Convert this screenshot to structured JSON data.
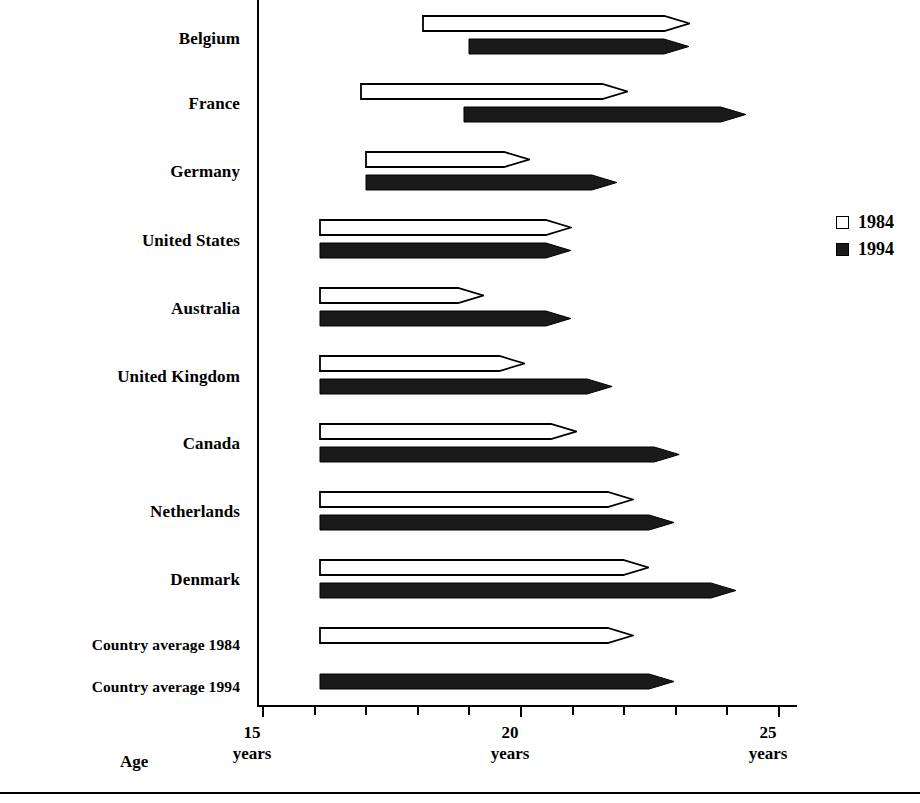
{
  "chart_data": {
    "type": "bar",
    "orientation": "horizontal",
    "title": "",
    "xlabel": "Age",
    "ylabel": "",
    "xlim": [
      15,
      25.8
    ],
    "axis_start": 15,
    "grid": false,
    "legend_position": "right",
    "tick_labels": [
      {
        "value": 15,
        "line1": "15",
        "line2": "years"
      },
      {
        "value": 20,
        "line1": "20",
        "line2": "years"
      },
      {
        "value": 25,
        "line1": "25",
        "line2": "years"
      }
    ],
    "minor_tick_step": 1,
    "categories": [
      "Belgium",
      "France",
      "Germany",
      "United States",
      "Australia",
      "United Kingdom",
      "Canada",
      "Netherlands",
      "Denmark",
      "Country average 1984",
      "Country average 1994"
    ],
    "series": [
      {
        "name": "1984",
        "style": "outline",
        "color": "#ffffff",
        "bars": [
          {
            "category": "Belgium",
            "start": 18.1,
            "end": 23.3
          },
          {
            "category": "France",
            "start": 16.9,
            "end": 22.1
          },
          {
            "category": "Germany",
            "start": 17.0,
            "end": 20.2
          },
          {
            "category": "United States",
            "start": 16.1,
            "end": 21.0
          },
          {
            "category": "Australia",
            "start": 16.1,
            "end": 19.3
          },
          {
            "category": "United Kingdom",
            "start": 16.1,
            "end": 20.1
          },
          {
            "category": "Canada",
            "start": 16.1,
            "end": 21.1
          },
          {
            "category": "Netherlands",
            "start": 16.1,
            "end": 22.2
          },
          {
            "category": "Denmark",
            "start": 16.1,
            "end": 22.5
          },
          {
            "category": "Country average 1984",
            "start": 16.1,
            "end": 22.2
          }
        ]
      },
      {
        "name": "1994",
        "style": "filled",
        "color": "#1a1a1a",
        "bars": [
          {
            "category": "Belgium",
            "start": 19.0,
            "end": 23.3
          },
          {
            "category": "France",
            "start": 18.9,
            "end": 24.4
          },
          {
            "category": "Germany",
            "start": 17.0,
            "end": 21.9
          },
          {
            "category": "United States",
            "start": 16.1,
            "end": 21.0
          },
          {
            "category": "Australia",
            "start": 16.1,
            "end": 21.0
          },
          {
            "category": "United Kingdom",
            "start": 16.1,
            "end": 21.8
          },
          {
            "category": "Canada",
            "start": 16.1,
            "end": 23.1
          },
          {
            "category": "Netherlands",
            "start": 16.1,
            "end": 23.0
          },
          {
            "category": "Denmark",
            "start": 16.1,
            "end": 24.2
          },
          {
            "category": "Country average 1994",
            "start": 16.1,
            "end": 23.0
          }
        ]
      }
    ],
    "legend": [
      {
        "label": "1984",
        "style": "outline"
      },
      {
        "label": "1994",
        "style": "filled"
      }
    ]
  },
  "labels": {
    "belgium": "Belgium",
    "france": "France",
    "germany": "Germany",
    "united_states": "United States",
    "australia": "Australia",
    "united_kingdom": "United Kingdom",
    "canada": "Canada",
    "netherlands": "Netherlands",
    "denmark": "Denmark",
    "country_average_1984": "Country average 1984",
    "country_average_1994": "Country average 1994"
  },
  "axis": {
    "title": "Age",
    "tick_15_value": "15",
    "tick_15_unit": "years",
    "tick_20_value": "20",
    "tick_20_unit": "years",
    "tick_25_value": "25",
    "tick_25_unit": "years"
  },
  "legend": {
    "item_1984": "1984",
    "item_1994": "1994"
  },
  "colors": {
    "ink": "#000000",
    "fill_1994": "#1a1a1a",
    "fill_1984": "#ffffff",
    "background": "#ffffff"
  }
}
